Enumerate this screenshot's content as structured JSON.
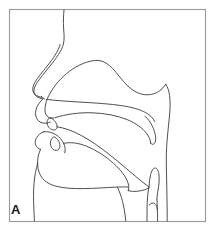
{
  "figure": {
    "panel_label": "A",
    "type": "line-drawing",
    "background_color": "#ffffff",
    "line_color": "#3b3b3b",
    "frame_color": "#9a9a9a",
    "frame": {
      "x": 9,
      "y": 9,
      "width": 197,
      "height": 213
    },
    "structures": [
      {
        "name": "forehead-nose-profile",
        "label": "Forehead and nose profile",
        "description": "Outer facial profile descending from the top border through the bridge and tip of the nose"
      },
      {
        "name": "nostril-alar-line",
        "label": "Nostril / alar crease",
        "description": "Second short curve paralleling the nose tip forming the nostril"
      },
      {
        "name": "nasal-cavity",
        "label": "Nasal cavity",
        "description": "Large domed chamber above the hard palate extending posteriorly"
      },
      {
        "name": "hard-palate",
        "label": "Hard palate",
        "description": "Upper boundary of the oral cavity running posteriorly from the alveolar ridge"
      },
      {
        "name": "soft-palate-velum",
        "label": "Soft palate (velum)",
        "description": "Raised velum curving down and back toward the pharyngeal wall"
      },
      {
        "name": "uvula",
        "label": "Uvula",
        "description": "Narrow tapering tip at the posterior end of the velum"
      },
      {
        "name": "upper-lip",
        "label": "Upper lip",
        "description": "Anterior boundary of the oral cavity above the upper incisor"
      },
      {
        "name": "upper-incisor",
        "label": "Upper incisor",
        "description": "Small pointed tooth outline below the alveolar ridge"
      },
      {
        "name": "lower-lip",
        "label": "Lower lip",
        "description": "Anterior boundary below the oral opening"
      },
      {
        "name": "lower-incisor",
        "label": "Lower incisor",
        "description": "Small pointed tooth outline rising from the mandible"
      },
      {
        "name": "tongue-body",
        "label": "Tongue body",
        "description": "Large rounded mass filling the oral cavity with the tip near the lower incisor"
      },
      {
        "name": "tongue-root",
        "label": "Tongue root",
        "description": "Posterior tongue surface descending into the pharynx"
      },
      {
        "name": "mandible-chin",
        "label": "Mandible and chin",
        "description": "Outer jaw profile descending from the lower lip to the neck"
      },
      {
        "name": "pharyngeal-wall",
        "label": "Posterior pharyngeal wall",
        "description": "Long vertical boundary at the back of the throat"
      },
      {
        "name": "epiglottis",
        "label": "Epiglottis",
        "description": "Narrow upright leaf-shaped structure above the larynx"
      },
      {
        "name": "larynx",
        "label": "Larynx / laryngeal vestibule",
        "description": "Paired vertical outlines descending to the bottom border"
      },
      {
        "name": "neck-profile",
        "label": "Neck profile",
        "description": "Anterior neck contour running down to the lower border"
      }
    ]
  }
}
